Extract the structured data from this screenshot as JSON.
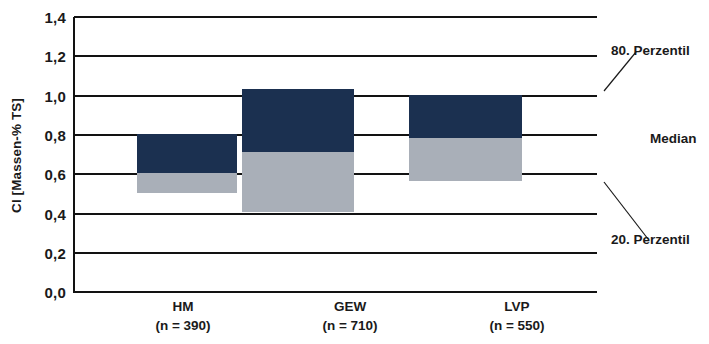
{
  "chart_data": {
    "type": "bar",
    "title": "",
    "subtitle": "",
    "xlabel": "",
    "ylabel": "Cl [Massen-% TS]",
    "ylim": [
      0.0,
      1.4
    ],
    "ytick_labels": [
      "1,4",
      "1,2",
      "1,0",
      "0,8",
      "0,6",
      "0,4",
      "0,2",
      "0,0"
    ],
    "ytick_values": [
      1.4,
      1.2,
      1.0,
      0.8,
      0.6,
      0.4,
      0.2,
      0.0
    ],
    "grid": true,
    "legend_position": "right-annotations",
    "categories": [
      "HM",
      "GEW",
      "LVP"
    ],
    "category_sublabels": [
      "(n = 390)",
      "(n = 710)",
      "(n = 550)"
    ],
    "series": [
      {
        "name": "20. Perzentil",
        "values": [
          0.5,
          0.4,
          0.56
        ]
      },
      {
        "name": "Median",
        "values": [
          0.6,
          0.71,
          0.78
        ]
      },
      {
        "name": "80. Perzentil",
        "values": [
          0.8,
          1.03,
          1.0
        ]
      }
    ],
    "annotations": [
      {
        "label": "80. Perzentil"
      },
      {
        "label": "Median"
      },
      {
        "label": "20. Perzentil"
      }
    ],
    "colors": {
      "upper_segment": "#1b3050",
      "lower_segment": "#a9afb8",
      "gridline": "#121212",
      "text": "#1a1a1a",
      "background": "#ffffff"
    }
  }
}
